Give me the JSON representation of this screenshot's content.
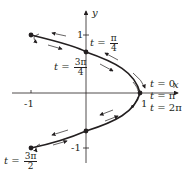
{
  "diagram": {
    "type": "parametric-curve",
    "colors": {
      "ink": "#231f20",
      "background": "#ffffff"
    },
    "axes": {
      "x_label": "x",
      "y_label": "y",
      "x_ticks": [
        "-1",
        "1"
      ],
      "y_ticks": [
        "1",
        "-1"
      ]
    },
    "labels": {
      "t0": {
        "var": "t",
        "eq": " = 0"
      },
      "tpi": {
        "var": "t",
        "eq": " = π"
      },
      "t2pi": {
        "var": "t",
        "eq": " = 2π"
      },
      "tpi4": {
        "var": "t",
        "eq": " = ",
        "num": "π",
        "den": "4"
      },
      "t3pi4": {
        "var": "t",
        "eq": " = ",
        "num": "3π",
        "den": "4"
      },
      "t3pi2": {
        "var": "t",
        "eq": " = ",
        "num": "3π",
        "den": "2"
      }
    },
    "points": [
      {
        "name": "origin-crossing-top",
        "at": "t = π/4, 3π/4"
      },
      {
        "name": "right-vertex",
        "at": "t = 0, π, 2π"
      },
      {
        "name": "top-left-endpoint",
        "at": "t = π/2"
      },
      {
        "name": "bottom-left-endpoint",
        "at": "t = 3π/2"
      },
      {
        "name": "origin-crossing-bottom",
        "at": "t = 5π/4, 7π/4"
      }
    ]
  }
}
